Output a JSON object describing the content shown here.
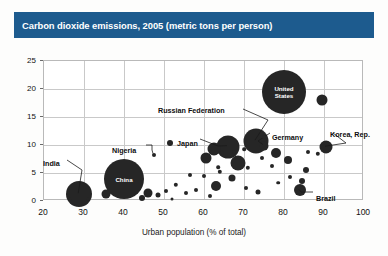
{
  "title": "Carbon dioxide emissions, 2005 (metric tons per person)",
  "colors": {
    "banner": "#1d5b8e",
    "banner_text": "#ffffff",
    "bubble": "#262626",
    "grid": "#c9c9c9",
    "frame": "#b9b9b9",
    "background": "#fdfdfc"
  },
  "chart_data": {
    "type": "scatter",
    "title": "Carbon dioxide emissions, 2005 (metric tons per person)",
    "xlabel": "Urban population (% of total)",
    "ylabel": "",
    "xlim": [
      20,
      100
    ],
    "ylim": [
      0,
      25
    ],
    "xticks": [
      20,
      30,
      40,
      50,
      60,
      70,
      80,
      90,
      100
    ],
    "yticks": [
      0,
      5,
      10,
      15,
      20,
      25
    ],
    "grid": true,
    "legend": "none",
    "size_encodes": "population",
    "annotations": [
      "United States",
      "Russian Federation",
      "Japan",
      "Germany",
      "Korea, Rep.",
      "Nigeria",
      "China",
      "India",
      "Brazil"
    ],
    "points": [
      {
        "label": "United States",
        "x": 80.0,
        "y": 19.5,
        "r": 22,
        "label_style": "inside"
      },
      {
        "label": "",
        "x": 89.5,
        "y": 18.0,
        "r": 5.5,
        "label_style": "none"
      },
      {
        "label": "Russian Federation",
        "x": 73.0,
        "y": 10.7,
        "r": 12.5,
        "label_style": "callout"
      },
      {
        "label": "Japan",
        "x": 66.0,
        "y": 9.7,
        "r": 11.5,
        "label_style": "callout"
      },
      {
        "label": "Germany",
        "x": 75.0,
        "y": 9.9,
        "r": 4.5,
        "label_style": "callout"
      },
      {
        "label": "Korea, Rep.",
        "x": 90.5,
        "y": 9.6,
        "r": 6.5,
        "label_style": "callout"
      },
      {
        "label": "China",
        "x": 40.0,
        "y": 4.0,
        "r": 20,
        "label_style": "inside"
      },
      {
        "label": "India",
        "x": 28.8,
        "y": 1.2,
        "r": 13,
        "label_style": "callout"
      },
      {
        "label": "Nigeria",
        "x": 47.5,
        "y": 8.3,
        "r": 2.0,
        "label_style": "callout"
      },
      {
        "label": "Brazil",
        "x": 84.0,
        "y": 1.9,
        "r": 6.0,
        "label_style": "callout"
      },
      {
        "label": "",
        "x": 62.5,
        "y": 9.2,
        "r": 6.5,
        "label_style": "none"
      },
      {
        "label": "",
        "x": 60.5,
        "y": 7.6,
        "r": 5.5,
        "label_style": "none"
      },
      {
        "label": "",
        "x": 68.5,
        "y": 6.8,
        "r": 7.5,
        "label_style": "none"
      },
      {
        "label": "",
        "x": 64.5,
        "y": 8.6,
        "r": 2.2,
        "label_style": "none"
      },
      {
        "label": "",
        "x": 67.5,
        "y": 8.8,
        "r": 2.0,
        "label_style": "none"
      },
      {
        "label": "",
        "x": 78.0,
        "y": 8.5,
        "r": 5.0,
        "label_style": "none"
      },
      {
        "label": "",
        "x": 81.0,
        "y": 7.3,
        "r": 4.0,
        "label_style": "none"
      },
      {
        "label": "",
        "x": 74.5,
        "y": 7.6,
        "r": 2.0,
        "label_style": "none"
      },
      {
        "label": "",
        "x": 77.0,
        "y": 6.2,
        "r": 2.0,
        "label_style": "none"
      },
      {
        "label": "",
        "x": 71.0,
        "y": 5.9,
        "r": 2.2,
        "label_style": "none"
      },
      {
        "label": "",
        "x": 85.5,
        "y": 5.6,
        "r": 3.0,
        "label_style": "none"
      },
      {
        "label": "",
        "x": 81.5,
        "y": 4.3,
        "r": 2.0,
        "label_style": "none"
      },
      {
        "label": "",
        "x": 84.5,
        "y": 3.6,
        "r": 3.0,
        "label_style": "none"
      },
      {
        "label": "",
        "x": 78.5,
        "y": 3.3,
        "r": 1.8,
        "label_style": "none"
      },
      {
        "label": "",
        "x": 64.0,
        "y": 5.2,
        "r": 2.2,
        "label_style": "none"
      },
      {
        "label": "",
        "x": 60.0,
        "y": 4.4,
        "r": 2.0,
        "label_style": "none"
      },
      {
        "label": "",
        "x": 67.0,
        "y": 4.1,
        "r": 3.5,
        "label_style": "none"
      },
      {
        "label": "",
        "x": 63.0,
        "y": 2.6,
        "r": 5.0,
        "label_style": "none"
      },
      {
        "label": "",
        "x": 58.0,
        "y": 2.0,
        "r": 2.0,
        "label_style": "none"
      },
      {
        "label": "",
        "x": 70.5,
        "y": 2.4,
        "r": 2.0,
        "label_style": "none"
      },
      {
        "label": "",
        "x": 73.5,
        "y": 1.6,
        "r": 2.5,
        "label_style": "none"
      },
      {
        "label": "",
        "x": 56.5,
        "y": 4.6,
        "r": 2.0,
        "label_style": "none"
      },
      {
        "label": "",
        "x": 53.0,
        "y": 2.9,
        "r": 2.2,
        "label_style": "none"
      },
      {
        "label": "",
        "x": 50.5,
        "y": 1.7,
        "r": 2.0,
        "label_style": "none"
      },
      {
        "label": "",
        "x": 55.5,
        "y": 1.4,
        "r": 2.0,
        "label_style": "none"
      },
      {
        "label": "",
        "x": 61.5,
        "y": 0.9,
        "r": 2.0,
        "label_style": "none"
      },
      {
        "label": "",
        "x": 46.0,
        "y": 1.5,
        "r": 4.5,
        "label_style": "none"
      },
      {
        "label": "",
        "x": 48.5,
        "y": 1.1,
        "r": 2.5,
        "label_style": "none"
      },
      {
        "label": "",
        "x": 35.5,
        "y": 1.3,
        "r": 4.5,
        "label_style": "none"
      },
      {
        "label": "",
        "x": 44.5,
        "y": 0.6,
        "r": 3.0,
        "label_style": "none"
      },
      {
        "label": "",
        "x": 31.0,
        "y": 0.4,
        "r": 1.5,
        "label_style": "none"
      },
      {
        "label": "",
        "x": 26.5,
        "y": 0.4,
        "r": 1.5,
        "label_style": "none"
      },
      {
        "label": "",
        "x": 52.0,
        "y": 0.4,
        "r": 1.5,
        "label_style": "none"
      },
      {
        "label": "",
        "x": 63.5,
        "y": 6.0,
        "r": 1.8,
        "label_style": "none"
      },
      {
        "label": "",
        "x": 86.0,
        "y": 8.7,
        "r": 2.0,
        "label_style": "none"
      },
      {
        "label": "",
        "x": 88.5,
        "y": 8.4,
        "r": 2.2,
        "label_style": "none"
      },
      {
        "label": "",
        "x": 70.0,
        "y": 9.3,
        "r": 1.8,
        "label_style": "none"
      }
    ]
  },
  "axis": {
    "x_title": "Urban population (% of total)",
    "x_tick_labels": [
      "20",
      "30",
      "40",
      "50",
      "60",
      "70",
      "80",
      "90",
      "100"
    ],
    "y_tick_labels": [
      "0",
      "5",
      "10",
      "15",
      "20",
      "25"
    ]
  },
  "callouts": [
    {
      "name": "united-states",
      "text": "United States"
    },
    {
      "name": "russian-federation",
      "text": "Russian Federation"
    },
    {
      "name": "japan",
      "text": "Japan"
    },
    {
      "name": "germany",
      "text": "Germany"
    },
    {
      "name": "korea-rep",
      "text": "Korea, Rep."
    },
    {
      "name": "nigeria",
      "text": "Nigeria"
    },
    {
      "name": "china",
      "text": "China"
    },
    {
      "name": "india",
      "text": "India"
    },
    {
      "name": "brazil",
      "text": "Brazil"
    }
  ]
}
